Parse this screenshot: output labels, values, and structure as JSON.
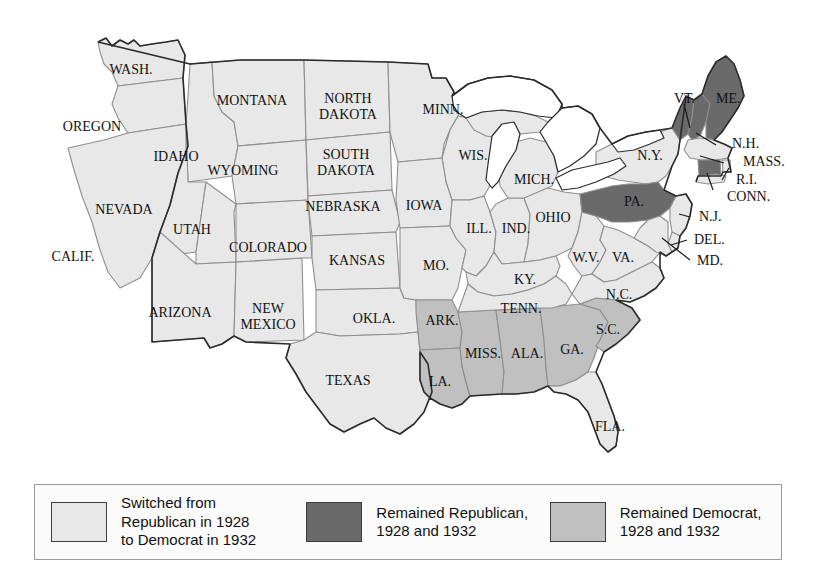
{
  "figure": {
    "background_color": "#ffffff"
  },
  "map": {
    "name": "united-states-map",
    "colors": {
      "switched": "#e8e8e8",
      "republican": "#6a6a6a",
      "democrat": "#c0c0c0",
      "water": "#ffffff",
      "state_border": "#8e8e8e",
      "nation_border": "#2b2b2b",
      "label_color": "#111111"
    },
    "states": [
      {
        "abbr": "WASH.",
        "label": "WASH.",
        "category": "switched",
        "label_x": 131,
        "label_y": 71,
        "font_size": 14
      },
      {
        "abbr": "OREGON",
        "label": "OREGON",
        "category": "switched",
        "label_x": 92,
        "label_y": 128,
        "font_size": 14
      },
      {
        "abbr": "CALIF.",
        "label": "CALIF.",
        "category": "switched",
        "label_x": 73,
        "label_y": 258,
        "font_size": 14
      },
      {
        "abbr": "IDAHO",
        "label": "IDAHO",
        "category": "switched",
        "label_x": 176,
        "label_y": 158,
        "font_size": 14
      },
      {
        "abbr": "NEVADA",
        "label": "NEVADA",
        "category": "switched",
        "label_x": 124,
        "label_y": 211,
        "font_size": 14
      },
      {
        "abbr": "MONTANA",
        "label": "MONTANA",
        "category": "switched",
        "label_x": 252,
        "label_y": 102,
        "font_size": 14
      },
      {
        "abbr": "WYOMING",
        "label": "WYOMING",
        "category": "switched",
        "label_x": 243,
        "label_y": 172,
        "font_size": 14
      },
      {
        "abbr": "UTAH",
        "label": "UTAH",
        "category": "switched",
        "label_x": 192,
        "label_y": 231,
        "font_size": 14
      },
      {
        "abbr": "ARIZONA",
        "label": "ARIZONA",
        "category": "switched",
        "label_x": 180,
        "label_y": 314,
        "font_size": 14
      },
      {
        "abbr": "NEW MEXICO",
        "label": "NEW\nMEXICO",
        "category": "switched",
        "label_x": 268,
        "label_y": 318,
        "font_size": 14
      },
      {
        "abbr": "COLORADO",
        "label": "COLORADO",
        "category": "switched",
        "label_x": 268,
        "label_y": 249,
        "font_size": 14
      },
      {
        "abbr": "NORTH DAKOTA",
        "label": "NORTH\nDAKOTA",
        "category": "switched",
        "label_x": 348,
        "label_y": 108,
        "font_size": 14
      },
      {
        "abbr": "SOUTH DAKOTA",
        "label": "SOUTH\nDAKOTA",
        "category": "switched",
        "label_x": 346,
        "label_y": 164,
        "font_size": 14
      },
      {
        "abbr": "NEBRASKA",
        "label": "NEBRASKA",
        "category": "switched",
        "label_x": 343,
        "label_y": 208,
        "font_size": 14
      },
      {
        "abbr": "KANSAS",
        "label": "KANSAS",
        "category": "switched",
        "label_x": 357,
        "label_y": 262,
        "font_size": 14
      },
      {
        "abbr": "OKLA.",
        "label": "OKLA.",
        "category": "switched",
        "label_x": 374,
        "label_y": 320,
        "font_size": 14
      },
      {
        "abbr": "TEXAS",
        "label": "TEXAS",
        "category": "switched",
        "label_x": 348,
        "label_y": 382,
        "font_size": 14
      },
      {
        "abbr": "MINN.",
        "label": "MINN.",
        "category": "switched",
        "label_x": 443,
        "label_y": 111,
        "font_size": 14
      },
      {
        "abbr": "IOWA",
        "label": "IOWA",
        "category": "switched",
        "label_x": 424,
        "label_y": 207,
        "font_size": 14
      },
      {
        "abbr": "WIS.",
        "label": "WIS.",
        "category": "switched",
        "label_x": 473,
        "label_y": 157,
        "font_size": 14
      },
      {
        "abbr": "MO.",
        "label": "MO.",
        "category": "switched",
        "label_x": 436,
        "label_y": 267,
        "font_size": 14
      },
      {
        "abbr": "ARK.",
        "label": "ARK.",
        "category": "democrat",
        "label_x": 442,
        "label_y": 322,
        "font_size": 14
      },
      {
        "abbr": "LA.",
        "label": "LA.",
        "category": "democrat",
        "label_x": 440,
        "label_y": 383,
        "font_size": 14
      },
      {
        "abbr": "MISS.",
        "label": "MISS.",
        "category": "democrat",
        "label_x": 483,
        "label_y": 355,
        "font_size": 14
      },
      {
        "abbr": "ALA.",
        "label": "ALA.",
        "category": "democrat",
        "label_x": 527,
        "label_y": 355,
        "font_size": 14
      },
      {
        "abbr": "GA.",
        "label": "GA.",
        "category": "democrat",
        "label_x": 572,
        "label_y": 351,
        "font_size": 14
      },
      {
        "abbr": "S.C.",
        "label": "S.C.",
        "category": "democrat",
        "label_x": 608,
        "label_y": 331,
        "font_size": 14
      },
      {
        "abbr": "TENN.",
        "label": "TENN.",
        "category": "switched",
        "label_x": 521,
        "label_y": 310,
        "font_size": 14
      },
      {
        "abbr": "KY.",
        "label": "KY.",
        "category": "switched",
        "label_x": 525,
        "label_y": 281,
        "font_size": 14
      },
      {
        "abbr": "ILL.",
        "label": "ILL.",
        "category": "switched",
        "label_x": 479,
        "label_y": 230,
        "font_size": 14
      },
      {
        "abbr": "IND.",
        "label": "IND.",
        "category": "switched",
        "label_x": 516,
        "label_y": 230,
        "font_size": 14
      },
      {
        "abbr": "OHIO",
        "label": "OHIO",
        "category": "switched",
        "label_x": 553,
        "label_y": 219,
        "font_size": 14
      },
      {
        "abbr": "MICH.",
        "label": "MICH.",
        "category": "switched",
        "label_x": 534,
        "label_y": 181,
        "font_size": 14
      },
      {
        "abbr": "W.V.",
        "label": "W.V.",
        "category": "switched",
        "label_x": 586,
        "label_y": 259,
        "font_size": 14
      },
      {
        "abbr": "VA.",
        "label": "VA.",
        "category": "switched",
        "label_x": 623,
        "label_y": 259,
        "font_size": 14
      },
      {
        "abbr": "N.C.",
        "label": "N.C.",
        "category": "switched",
        "label_x": 619,
        "label_y": 296,
        "font_size": 14
      },
      {
        "abbr": "FLA.",
        "label": "FLA.",
        "category": "switched",
        "label_x": 610,
        "label_y": 428,
        "font_size": 14
      },
      {
        "abbr": "N.Y.",
        "label": "N.Y.",
        "category": "switched",
        "label_x": 650,
        "label_y": 157,
        "font_size": 14
      },
      {
        "abbr": "PA.",
        "label": "PA.",
        "category": "republican",
        "label_x": 634,
        "label_y": 203,
        "font_size": 14
      },
      {
        "abbr": "VT.",
        "label": "VT.",
        "category": "republican",
        "label_x": 674,
        "label_y": 100,
        "font_size": 14
      },
      {
        "abbr": "ME.",
        "label": "ME.",
        "category": "republican",
        "label_x": 716,
        "label_y": 100,
        "font_size": 14
      },
      {
        "abbr": "N.H.",
        "label": "N.H.",
        "category": "republican",
        "label_x": 732,
        "label_y": 145,
        "font_size": 14
      },
      {
        "abbr": "MASS.",
        "label": "MASS.",
        "category": "switched",
        "label_x": 743,
        "label_y": 163,
        "font_size": 14
      },
      {
        "abbr": "R.I.",
        "label": "R.I.",
        "category": "switched",
        "label_x": 736,
        "label_y": 181,
        "font_size": 14
      },
      {
        "abbr": "CONN.",
        "label": "CONN.",
        "category": "republican",
        "label_x": 727,
        "label_y": 198,
        "font_size": 14
      },
      {
        "abbr": "N.J.",
        "label": "N.J.",
        "category": "switched",
        "label_x": 699,
        "label_y": 218,
        "font_size": 14
      },
      {
        "abbr": "DEL.",
        "label": "DEL.",
        "category": "switched",
        "label_x": 694,
        "label_y": 241,
        "font_size": 14
      },
      {
        "abbr": "MD.",
        "label": "MD.",
        "category": "switched",
        "label_x": 697,
        "label_y": 262,
        "font_size": 14
      }
    ],
    "callouts": [
      "VT.",
      "ME.",
      "N.H.",
      "MASS.",
      "R.I.",
      "CONN.",
      "N.J.",
      "DEL.",
      "MD."
    ]
  },
  "legend": {
    "name": "map-legend",
    "entries": [
      {
        "swatch_color": "#e8e8e8",
        "text": "Switched from\nRepublican in 1928\nto Democrat in 1932"
      },
      {
        "swatch_color": "#6a6a6a",
        "text": "Remained Republican,\n1928 and 1932"
      },
      {
        "swatch_color": "#c0c0c0",
        "text": "Remained Democrat,\n1928 and 1932"
      }
    ]
  }
}
